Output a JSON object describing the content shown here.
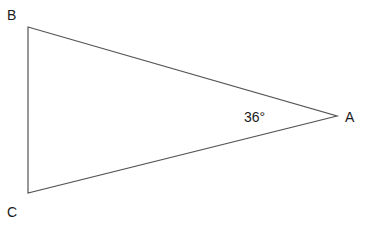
{
  "diagram": {
    "type": "triangle",
    "vertices": [
      {
        "name": "A",
        "x": 337,
        "y": 116
      },
      {
        "name": "B",
        "x": 28,
        "y": 27
      },
      {
        "name": "C",
        "x": 28,
        "y": 193
      }
    ],
    "labels": {
      "A": "A",
      "B": "B",
      "C": "C",
      "angle_A": "36°"
    },
    "stroke_color": "#555555"
  }
}
